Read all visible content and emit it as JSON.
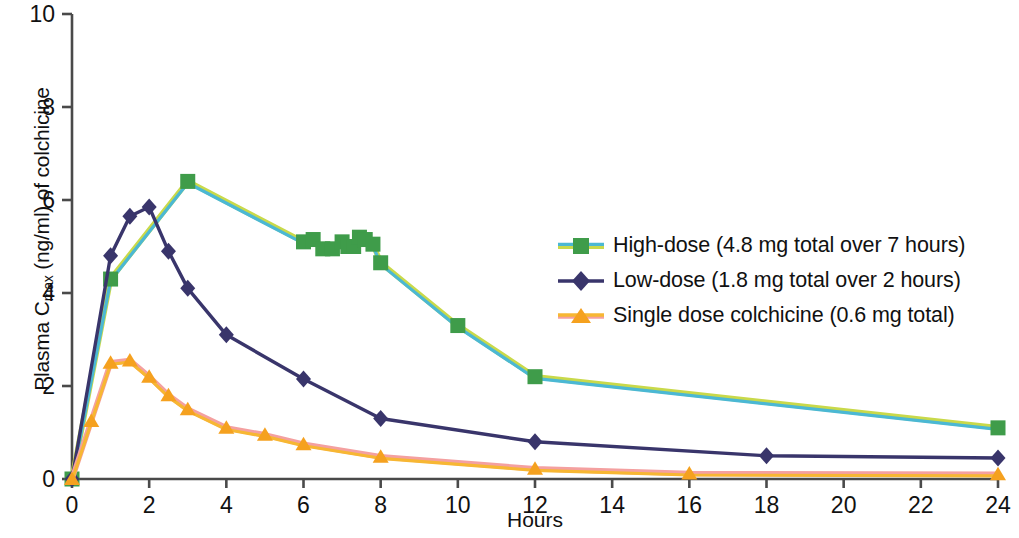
{
  "chart_data": {
    "type": "line",
    "title": "",
    "xlabel": "Hours",
    "ylabel": "Plasma Cmax (ng/ml) of colchicine",
    "ylabel_main": "Plasma C",
    "ylabel_sub": "max",
    "ylabel_rest": " (ng/ml) of colchicine",
    "xlim": [
      0,
      24
    ],
    "ylim": [
      0,
      10
    ],
    "xticks": [
      0,
      2,
      4,
      6,
      8,
      10,
      12,
      14,
      16,
      18,
      20,
      22,
      24
    ],
    "yticks": [
      0,
      2,
      4,
      6,
      8,
      10
    ],
    "xtick_labels": [
      "0",
      "2",
      "4",
      "6",
      "8",
      "10",
      "12",
      "14",
      "16",
      "18",
      "20",
      "22",
      "24"
    ],
    "ytick_labels": [
      "0",
      "2",
      "4",
      "6",
      "8",
      "10"
    ],
    "grid": false,
    "legend_position": "center-right",
    "series": [
      {
        "name": "High-dose (4.8 mg total over 7 hours)",
        "color": "#3f9c4a",
        "line_color": "#4bb8d4",
        "line_color2": "#c9d94a",
        "marker": "square",
        "points": [
          [
            0,
            0.0
          ],
          [
            1,
            4.3
          ],
          [
            3,
            6.4
          ],
          [
            6.0,
            5.1
          ],
          [
            6.25,
            5.15
          ],
          [
            6.5,
            4.95
          ],
          [
            6.75,
            4.95
          ],
          [
            7.0,
            5.1
          ],
          [
            7.15,
            5.0
          ],
          [
            7.3,
            5.0
          ],
          [
            7.45,
            5.2
          ],
          [
            7.6,
            5.15
          ],
          [
            7.8,
            5.05
          ],
          [
            8.0,
            4.65
          ],
          [
            10,
            3.3
          ],
          [
            12,
            2.2
          ],
          [
            24,
            1.1
          ]
        ]
      },
      {
        "name": "Low-dose (1.8 mg total over 2 hours)",
        "color": "#39356b",
        "line_color": "#39356b",
        "marker": "diamond",
        "points": [
          [
            0,
            0.0
          ],
          [
            1,
            4.8
          ],
          [
            1.5,
            5.65
          ],
          [
            2,
            5.85
          ],
          [
            2.5,
            4.9
          ],
          [
            3,
            4.1
          ],
          [
            4,
            3.1
          ],
          [
            6,
            2.15
          ],
          [
            8,
            1.3
          ],
          [
            12,
            0.8
          ],
          [
            18,
            0.5
          ],
          [
            24,
            0.45
          ]
        ]
      },
      {
        "name": "Single dose colchicine (0.6 mg total)",
        "color": "#f5a11f",
        "line_color": "#f7b733",
        "line_color2": "#f4a0a0",
        "marker": "triangle",
        "points": [
          [
            0,
            0.0
          ],
          [
            0.5,
            1.25
          ],
          [
            1.0,
            2.5
          ],
          [
            1.5,
            2.55
          ],
          [
            2.0,
            2.2
          ],
          [
            2.5,
            1.8
          ],
          [
            3.0,
            1.5
          ],
          [
            4.0,
            1.1
          ],
          [
            5.0,
            0.95
          ],
          [
            6.0,
            0.75
          ],
          [
            8.0,
            0.48
          ],
          [
            12.0,
            0.22
          ],
          [
            16.0,
            0.12
          ],
          [
            24.0,
            0.1
          ]
        ]
      }
    ]
  },
  "axes": {
    "x_axis_label": "Hours",
    "y_axis_label_main": "Plasma C",
    "y_axis_label_sub": "max",
    "y_axis_label_rest": " (ng/ml) of colchicine"
  },
  "legend": {
    "items": [
      {
        "label": "High-dose (4.8 mg total over 7 hours)",
        "marker": "square-marker",
        "color": "#3f9c4a"
      },
      {
        "label": "Low-dose (1.8 mg total over 2 hours)",
        "marker": "diamond-marker",
        "color": "#39356b"
      },
      {
        "label": "Single dose colchicine (0.6 mg total)",
        "marker": "triangle-marker",
        "color": "#f5a11f"
      }
    ]
  },
  "colors": {
    "high_dose_marker": "#3f9c4a",
    "high_dose_line": "#4bb8d4",
    "high_dose_line_alt": "#c9d94a",
    "low_dose": "#39356b",
    "single_dose_marker": "#f5a11f",
    "single_dose_line": "#f7b733",
    "single_dose_line_alt": "#f4a0a0",
    "axis": "#4a4a4a",
    "text": "#111111"
  }
}
